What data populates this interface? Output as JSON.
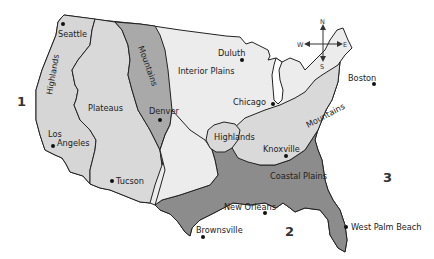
{
  "map": {
    "title": "Physical regions of the United States",
    "colors": {
      "background": "#ffffff",
      "interior_plains": "#ececec",
      "western_light": "#d6d6d6",
      "western_mountains": "#a9a9a9",
      "eastern_highlands": "#d9d9d9",
      "coastal_plains": "#8c8c8c",
      "border": "#222222"
    },
    "regions": [
      {
        "id": "western-highlands",
        "label": "Highlands"
      },
      {
        "id": "plateaus",
        "label": "Plateaus"
      },
      {
        "id": "rocky-mountains",
        "label": "Mountains"
      },
      {
        "id": "interior-plains",
        "label": "Interior Plains"
      },
      {
        "id": "ozark-highlands",
        "label": "Highlands"
      },
      {
        "id": "appalachian-mountains",
        "label": "Mountains"
      },
      {
        "id": "coastal-plains",
        "label": "Coastal Plains"
      }
    ],
    "cities": [
      {
        "name": "Seattle"
      },
      {
        "name": "Los"
      },
      {
        "name": "Angeles"
      },
      {
        "name": "Tucson"
      },
      {
        "name": "Denver"
      },
      {
        "name": "Duluth"
      },
      {
        "name": "Chicago"
      },
      {
        "name": "Boston"
      },
      {
        "name": "Knoxville"
      },
      {
        "name": "New Orleans"
      },
      {
        "name": "Brownsville"
      },
      {
        "name": "West Palm Beach"
      }
    ],
    "markers": [
      "1",
      "2",
      "3"
    ],
    "compass": {
      "n": "N",
      "s": "S",
      "e": "E",
      "w": "W"
    }
  }
}
